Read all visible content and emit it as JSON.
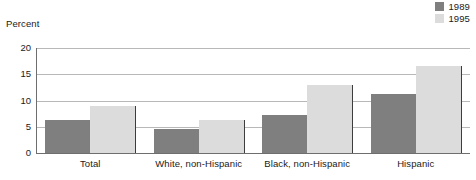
{
  "ylabel_text": "Percent",
  "legend": {
    "entries": [
      {
        "label": "1989",
        "color": "#7f7f7f"
      },
      {
        "label": "1995",
        "color": "#dcdcdc"
      }
    ]
  },
  "yticks": [
    {
      "label": "0",
      "value": 0
    },
    {
      "label": "5",
      "value": 5
    },
    {
      "label": "10",
      "value": 10
    },
    {
      "label": "15",
      "value": 15
    },
    {
      "label": "20",
      "value": 20
    }
  ],
  "chart_data": {
    "type": "bar",
    "title": "",
    "subtitle": "",
    "xlabel": "",
    "ylabel": "Percent",
    "ylim": [
      0,
      20
    ],
    "yticks": [
      0,
      5,
      10,
      15,
      20
    ],
    "grid": true,
    "legend_position": "top-right",
    "categories": [
      "Total",
      "White, non-Hispanic",
      "Black, non-Hispanic",
      "Hispanic"
    ],
    "series": [
      {
        "name": "1989",
        "color": "#7f7f7f",
        "values": [
          6.2,
          4.6,
          7.3,
          11.2
        ]
      },
      {
        "name": "1995",
        "color": "#dcdcdc",
        "values": [
          9.0,
          6.2,
          13.0,
          16.5
        ]
      }
    ]
  }
}
